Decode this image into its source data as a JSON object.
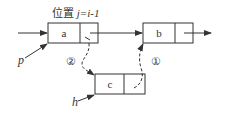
{
  "diagram": {
    "type": "linked-list-insertion",
    "position_label": "位置 j=i-1",
    "position_label_parts": {
      "prefix": "位置 ",
      "expr": "j=i-1"
    },
    "nodes": [
      {
        "id": "a",
        "label": "a"
      },
      {
        "id": "b",
        "label": "b"
      },
      {
        "id": "c",
        "label": "c"
      }
    ],
    "pointers": [
      {
        "label": "p",
        "target": "a"
      },
      {
        "label": "h",
        "target": "c"
      }
    ],
    "steps": [
      {
        "label": "①",
        "description": "c.next -> b"
      },
      {
        "label": "②",
        "description": "a.next -> c"
      }
    ],
    "colors": {
      "stroke": "#333333",
      "background": "#ffffff"
    }
  }
}
